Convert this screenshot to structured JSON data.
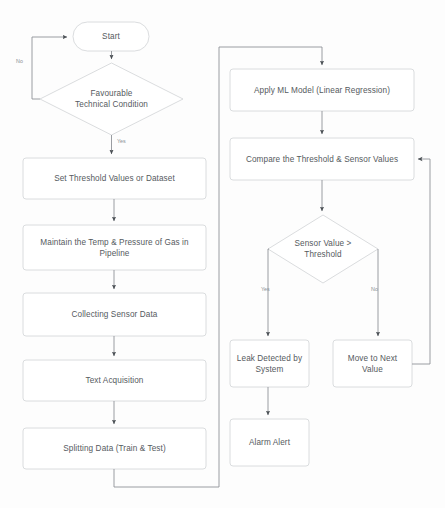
{
  "diagram": {
    "type": "flowchart",
    "canvas": {
      "width": 445,
      "height": 508
    },
    "colors": {
      "background": "#fdfdfd",
      "node_stroke": "#d6d8da",
      "node_fill": "#ffffff",
      "edge_stroke": "#8e9297",
      "text": "#555a5e",
      "edge_label_text": "#8b9095"
    },
    "nodes": [
      {
        "id": "start",
        "shape": "stadium",
        "label": "Start",
        "x": 73,
        "y": 22,
        "w": 76,
        "h": 29
      },
      {
        "id": "favourable-technical-condition",
        "shape": "diamond",
        "label": "Favourable\nTechnical Condition",
        "x": 40,
        "y": 63,
        "w": 143,
        "h": 72
      },
      {
        "id": "set-threshold-values",
        "shape": "rect",
        "label": "Set Threshold Values or Dataset",
        "x": 23,
        "y": 158,
        "w": 183,
        "h": 41
      },
      {
        "id": "maintain-temp-pressure",
        "shape": "rect",
        "label": "Maintain the Temp & Pressure of Gas in Pipeline",
        "x": 23,
        "y": 225,
        "w": 183,
        "h": 45
      },
      {
        "id": "collecting-sensor-data",
        "shape": "rect",
        "label": "Collecting Sensor Data",
        "x": 23,
        "y": 293,
        "w": 183,
        "h": 43
      },
      {
        "id": "text-acquisition",
        "shape": "rect",
        "label": "Text Acquisition",
        "x": 23,
        "y": 360,
        "w": 183,
        "h": 41
      },
      {
        "id": "splitting-data",
        "shape": "rect",
        "label": "Splitting Data (Train & Test)",
        "x": 23,
        "y": 428,
        "w": 183,
        "h": 41
      },
      {
        "id": "apply-ml-model",
        "shape": "rect",
        "label": "Apply ML Model (Linear Regression)",
        "x": 230,
        "y": 69,
        "w": 184,
        "h": 42
      },
      {
        "id": "compare-threshold-sensor",
        "shape": "rect",
        "label": "Compare the Threshold & Sensor Values",
        "x": 230,
        "y": 138,
        "w": 184,
        "h": 42
      },
      {
        "id": "sensor-value-threshold",
        "shape": "diamond",
        "label": "Sensor Value >\nThreshold",
        "x": 268,
        "y": 215,
        "w": 110,
        "h": 68
      },
      {
        "id": "leak-detected",
        "shape": "rect",
        "label": "Leak Detected by System",
        "x": 230,
        "y": 340,
        "w": 79,
        "h": 47
      },
      {
        "id": "move-to-next-value",
        "shape": "rect",
        "label": "Move to Next Value",
        "x": 333,
        "y": 340,
        "w": 79,
        "h": 47
      },
      {
        "id": "alarm-alert",
        "shape": "rect",
        "label": "Alarm Alert",
        "x": 230,
        "y": 419,
        "w": 79,
        "h": 47
      }
    ],
    "edges": [
      {
        "id": "start-to-condition",
        "from": "start",
        "to": "favourable-technical-condition",
        "label": ""
      },
      {
        "id": "condition-no-to-start",
        "from": "favourable-technical-condition",
        "to": "start",
        "label": "No"
      },
      {
        "id": "condition-yes-to-threshold",
        "from": "favourable-technical-condition",
        "to": "set-threshold-values",
        "label": "Yes"
      },
      {
        "id": "threshold-to-maintain",
        "from": "set-threshold-values",
        "to": "maintain-temp-pressure",
        "label": ""
      },
      {
        "id": "maintain-to-collecting",
        "from": "maintain-temp-pressure",
        "to": "collecting-sensor-data",
        "label": ""
      },
      {
        "id": "collecting-to-text",
        "from": "collecting-sensor-data",
        "to": "text-acquisition",
        "label": ""
      },
      {
        "id": "text-to-splitting",
        "from": "text-acquisition",
        "to": "splitting-data",
        "label": ""
      },
      {
        "id": "splitting-to-apply-ml",
        "from": "splitting-data",
        "to": "apply-ml-model",
        "label": ""
      },
      {
        "id": "apply-ml-to-compare",
        "from": "apply-ml-model",
        "to": "compare-threshold-sensor",
        "label": ""
      },
      {
        "id": "compare-to-sensor-check",
        "from": "compare-threshold-sensor",
        "to": "sensor-value-threshold",
        "label": ""
      },
      {
        "id": "sensor-yes-to-leak",
        "from": "sensor-value-threshold",
        "to": "leak-detected",
        "label": "Yes"
      },
      {
        "id": "sensor-no-to-move-next",
        "from": "sensor-value-threshold",
        "to": "move-to-next-value",
        "label": "No"
      },
      {
        "id": "leak-to-alarm",
        "from": "leak-detected",
        "to": "alarm-alert",
        "label": ""
      },
      {
        "id": "move-next-to-compare",
        "from": "move-to-next-value",
        "to": "compare-threshold-sensor",
        "label": ""
      }
    ],
    "edge_labels": {
      "condition_no": "No",
      "condition_yes": "Yes",
      "sensor_yes": "Yes",
      "sensor_no": "No"
    }
  }
}
